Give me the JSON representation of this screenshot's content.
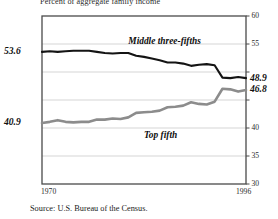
{
  "title": "Percent of aggregate family income",
  "source": "Source: U.S. Bureau of the Census.",
  "chart_data": {
    "type": "line",
    "title": "Percent of aggregate family income",
    "subtitle": "",
    "xlabel": "",
    "ylabel": "Percent of aggregate family income",
    "xlim": [
      1970,
      1996
    ],
    "ylim": [
      30,
      60
    ],
    "grid": true,
    "grid_axis": "y",
    "legend": "inline-annotations",
    "yticks": [
      30,
      35,
      40,
      45,
      50,
      55,
      60
    ],
    "ytick_labels": [
      "30",
      "35",
      "40",
      "45",
      "50",
      "55",
      "60"
    ],
    "ytick_side": "right",
    "xticks": [
      1970,
      1996
    ],
    "xtick_labels": [
      "1970",
      "1996"
    ],
    "annotations": [
      {
        "text": "53.6",
        "series": "Middle three-fifths",
        "x": 1970,
        "y": 53.6,
        "side": "left"
      },
      {
        "text": "48.9",
        "series": "Middle three-fifths",
        "x": 1996,
        "y": 48.9,
        "side": "right"
      },
      {
        "text": "40.9",
        "series": "Top fifth",
        "x": 1970,
        "y": 40.9,
        "side": "left"
      },
      {
        "text": "46.8",
        "series": "Top fifth",
        "x": 1996,
        "y": 46.8,
        "side": "right"
      }
    ],
    "x": [
      1970,
      1971,
      1972,
      1973,
      1974,
      1975,
      1976,
      1977,
      1978,
      1979,
      1980,
      1981,
      1982,
      1983,
      1984,
      1985,
      1986,
      1987,
      1988,
      1989,
      1990,
      1991,
      1992,
      1993,
      1994,
      1995,
      1996
    ],
    "series": [
      {
        "name": "Middle three-fifths",
        "color": "#141414",
        "label_x": 1981,
        "label_y": 55.1,
        "values": [
          53.6,
          53.7,
          53.6,
          53.7,
          53.8,
          53.8,
          53.8,
          53.6,
          53.4,
          53.3,
          53.4,
          53.4,
          52.9,
          52.7,
          52.4,
          52.1,
          51.7,
          51.7,
          51.5,
          51.1,
          51.3,
          51.4,
          51.2,
          49.0,
          48.9,
          49.1,
          48.9
        ]
      },
      {
        "name": "Top fifth",
        "color": "#8c8c8c",
        "label_x": 1983,
        "label_y": 38.4,
        "values": [
          40.9,
          41.1,
          41.4,
          41.1,
          41.0,
          41.1,
          41.1,
          41.5,
          41.5,
          41.7,
          41.6,
          41.9,
          42.7,
          42.8,
          42.9,
          43.1,
          43.7,
          43.8,
          44.0,
          44.6,
          44.3,
          44.2,
          44.7,
          47.0,
          46.9,
          46.5,
          46.8
        ]
      }
    ]
  },
  "plot_geometry": {
    "left_px": 42,
    "right_px": 246,
    "top_px": 16,
    "bottom_px": 184
  }
}
